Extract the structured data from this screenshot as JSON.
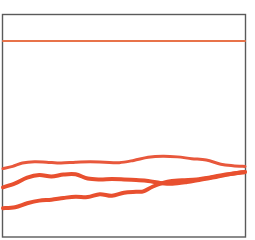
{
  "chart_data": {
    "type": "line",
    "title": "",
    "subtitle": "",
    "xlabel": "",
    "ylabel": "",
    "grid": false,
    "legend_position": "none",
    "xlim": [
      0,
      100
    ],
    "ylim": [
      0,
      100
    ],
    "axis_ticks": {
      "x": [],
      "y": []
    },
    "colors": {
      "series_top": "#E8734A",
      "series_upper": "#E8583C",
      "series_middle": "#E8502F",
      "series_lower": "#E8502F",
      "frame_stroke": "#5A5A5A",
      "background": "#FFFFFF"
    },
    "series": [
      {
        "name": "series-top",
        "color": "#E8734A",
        "stroke_width": 2.0,
        "x": [
          0,
          10,
          20,
          30,
          40,
          50,
          60,
          70,
          80,
          90,
          100
        ],
        "y": [
          88.2,
          88.2,
          88.2,
          88.2,
          88.2,
          88.2,
          88.2,
          88.2,
          88.2,
          88.2,
          88.2
        ]
      },
      {
        "name": "series-upper",
        "color": "#E8583C",
        "stroke_width": 3.0,
        "x": [
          0,
          4,
          8,
          13,
          18,
          24,
          30,
          36,
          42,
          48,
          54,
          60,
          66,
          72,
          78,
          84,
          90,
          95,
          100
        ],
        "y": [
          30.5,
          31.5,
          33.0,
          33.6,
          33.4,
          33.0,
          33.4,
          33.6,
          33.4,
          33.2,
          34.2,
          35.6,
          36.1,
          35.8,
          35.0,
          34.4,
          32.5,
          31.8,
          31.5
        ]
      },
      {
        "name": "series-middle",
        "color": "#E8502F",
        "stroke_width": 4.0,
        "x": [
          0,
          5,
          10,
          15,
          20,
          25,
          30,
          35,
          40,
          45,
          50,
          55,
          60,
          65,
          70,
          76,
          82,
          88,
          94,
          100
        ],
        "y": [
          22.0,
          23.8,
          26.4,
          27.6,
          26.9,
          27.8,
          27.9,
          26.0,
          25.6,
          25.8,
          25.6,
          25.3,
          24.9,
          24.0,
          23.6,
          24.4,
          25.6,
          26.7,
          28.0,
          29.0
        ]
      },
      {
        "name": "series-lower",
        "color": "#E8502F",
        "stroke_width": 4.0,
        "x": [
          0,
          5,
          10,
          15,
          20,
          25,
          30,
          35,
          40,
          45,
          50,
          55,
          58,
          62,
          68,
          74,
          80,
          86,
          92,
          100
        ],
        "y": [
          12.6,
          13.0,
          14.8,
          16.0,
          16.4,
          17.2,
          17.8,
          17.6,
          18.9,
          18.2,
          19.6,
          20.0,
          20.2,
          22.4,
          24.6,
          25.2,
          25.6,
          26.6,
          27.8,
          29.0
        ]
      }
    ],
    "annotations": []
  },
  "chart": {
    "alt": "Line chart with four salmon-orange lines on a white plot area with a thin grey rectangular frame"
  }
}
